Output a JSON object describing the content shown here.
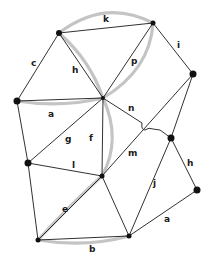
{
  "diagram": {
    "type": "graph",
    "nodes": [
      {
        "id": "N1",
        "x": 59,
        "y": 33
      },
      {
        "id": "N2",
        "x": 153,
        "y": 23
      },
      {
        "id": "N3",
        "x": 193,
        "y": 74
      },
      {
        "id": "N4",
        "x": 17,
        "y": 101
      },
      {
        "id": "N5",
        "x": 103,
        "y": 98
      },
      {
        "id": "N6",
        "x": 171,
        "y": 138
      },
      {
        "id": "N7",
        "x": 28,
        "y": 163
      },
      {
        "id": "N8",
        "x": 102,
        "y": 176
      },
      {
        "id": "N9",
        "x": 197,
        "y": 190
      },
      {
        "id": "N10",
        "x": 38,
        "y": 240
      },
      {
        "id": "N11",
        "x": 129,
        "y": 236
      }
    ],
    "labels": {
      "k": "k",
      "c": "c",
      "h_top": "h",
      "p": "p",
      "i": "i",
      "a_left": "a",
      "n": "n",
      "g": "g",
      "f": "f",
      "m": "m",
      "h_right": "h",
      "l": "l",
      "j": "j",
      "e": "e",
      "a_bottom": "a",
      "b": "b"
    },
    "highlight_color": "#c4c4c4",
    "edge_color": "#1a1a1a",
    "node_color": "#111111"
  }
}
